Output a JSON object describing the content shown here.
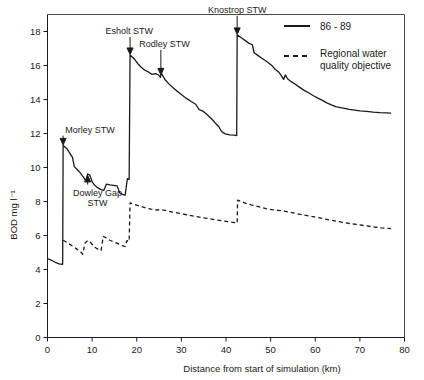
{
  "chart_data": {
    "type": "line",
    "title": "",
    "xlabel": "Distance from start of simulation (km)",
    "ylabel": "BOD mg l⁻¹",
    "xlim": [
      0,
      80
    ],
    "ylim": [
      0,
      19
    ],
    "xticks": [
      "0",
      "10",
      "20",
      "30",
      "40",
      "50",
      "60",
      "70",
      "80"
    ],
    "xtick_values": [
      0,
      10,
      20,
      30,
      40,
      50,
      60,
      70,
      80
    ],
    "yticks": [
      "0",
      "2",
      "4",
      "6",
      "8",
      "10",
      "12",
      "14",
      "16",
      "18"
    ],
    "ytick_values": [
      0,
      2,
      4,
      6,
      8,
      10,
      12,
      14,
      16,
      18
    ],
    "grid": false,
    "legend_position": "top-right",
    "series": [
      {
        "name": "86 - 89",
        "style": "solid",
        "color": "#1a1a1a",
        "points": [
          [
            0.0,
            4.62
          ],
          [
            0.6,
            4.58
          ],
          [
            1.2,
            4.5
          ],
          [
            1.9,
            4.4
          ],
          [
            2.6,
            4.33
          ],
          [
            3.4,
            4.31
          ],
          [
            3.5,
            11.3
          ],
          [
            4.3,
            11.12
          ],
          [
            5.0,
            10.85
          ],
          [
            5.6,
            10.6
          ],
          [
            6.0,
            10.05
          ],
          [
            6.6,
            9.9
          ],
          [
            7.3,
            9.7
          ],
          [
            8.0,
            9.45
          ],
          [
            8.6,
            9.2
          ],
          [
            9.0,
            9.62
          ],
          [
            9.5,
            9.55
          ],
          [
            10.0,
            9.15
          ],
          [
            10.6,
            8.95
          ],
          [
            11.3,
            8.8
          ],
          [
            12.0,
            8.7
          ],
          [
            12.6,
            8.65
          ],
          [
            13.2,
            9.02
          ],
          [
            14.0,
            8.98
          ],
          [
            14.8,
            8.95
          ],
          [
            15.6,
            8.92
          ],
          [
            16.2,
            8.5
          ],
          [
            16.8,
            8.42
          ],
          [
            17.4,
            8.38
          ],
          [
            17.9,
            9.35
          ],
          [
            18.3,
            9.3
          ],
          [
            18.5,
            16.62
          ],
          [
            19.4,
            16.4
          ],
          [
            20.2,
            16.12
          ],
          [
            21.0,
            15.9
          ],
          [
            21.8,
            15.72
          ],
          [
            22.6,
            15.62
          ],
          [
            23.4,
            15.48
          ],
          [
            24.2,
            15.52
          ],
          [
            24.9,
            15.44
          ],
          [
            25.3,
            15.3
          ],
          [
            25.5,
            15.55
          ],
          [
            26.3,
            15.18
          ],
          [
            27.2,
            14.92
          ],
          [
            28.2,
            14.68
          ],
          [
            29.2,
            14.45
          ],
          [
            30.2,
            14.25
          ],
          [
            31.2,
            14.05
          ],
          [
            32.2,
            13.88
          ],
          [
            33.2,
            13.72
          ],
          [
            34.0,
            13.4
          ],
          [
            34.8,
            13.32
          ],
          [
            35.8,
            13.1
          ],
          [
            36.8,
            12.85
          ],
          [
            37.6,
            12.62
          ],
          [
            38.4,
            12.4
          ],
          [
            39.0,
            12.12
          ],
          [
            39.8,
            11.98
          ],
          [
            40.8,
            11.92
          ],
          [
            41.8,
            11.9
          ],
          [
            42.4,
            11.88
          ],
          [
            42.5,
            17.8
          ],
          [
            43.6,
            17.6
          ],
          [
            44.4,
            17.45
          ],
          [
            45.2,
            17.3
          ],
          [
            45.9,
            17.22
          ],
          [
            46.3,
            16.75
          ],
          [
            47.2,
            16.58
          ],
          [
            48.2,
            16.4
          ],
          [
            49.2,
            16.22
          ],
          [
            50.2,
            16.02
          ],
          [
            51.0,
            15.78
          ],
          [
            51.8,
            15.62
          ],
          [
            52.4,
            15.4
          ],
          [
            52.9,
            15.18
          ],
          [
            53.3,
            15.45
          ],
          [
            53.8,
            15.22
          ],
          [
            54.6,
            15.05
          ],
          [
            55.6,
            14.88
          ],
          [
            56.6,
            14.7
          ],
          [
            57.6,
            14.52
          ],
          [
            58.6,
            14.38
          ],
          [
            59.6,
            14.22
          ],
          [
            60.6,
            14.08
          ],
          [
            61.6,
            13.95
          ],
          [
            62.6,
            13.8
          ],
          [
            63.6,
            13.68
          ],
          [
            64.6,
            13.58
          ],
          [
            65.6,
            13.52
          ],
          [
            66.6,
            13.48
          ],
          [
            67.6,
            13.42
          ],
          [
            68.8,
            13.38
          ],
          [
            70.0,
            13.33
          ],
          [
            71.5,
            13.3
          ],
          [
            73.0,
            13.26
          ],
          [
            74.5,
            13.23
          ],
          [
            76.0,
            13.21
          ],
          [
            77.0,
            13.2
          ]
        ]
      },
      {
        "name": "Regional water quality objective",
        "style": "dashed",
        "color": "#1a1a1a",
        "points": [
          [
            3.5,
            5.72
          ],
          [
            4.2,
            5.62
          ],
          [
            5.0,
            5.48
          ],
          [
            5.8,
            5.35
          ],
          [
            6.6,
            5.2
          ],
          [
            7.4,
            5.05
          ],
          [
            7.9,
            4.9
          ],
          [
            8.4,
            5.55
          ],
          [
            9.0,
            5.7
          ],
          [
            9.6,
            5.6
          ],
          [
            10.2,
            5.42
          ],
          [
            10.8,
            5.28
          ],
          [
            11.4,
            5.18
          ],
          [
            12.0,
            5.12
          ],
          [
            12.5,
            5.95
          ],
          [
            13.2,
            5.85
          ],
          [
            14.0,
            5.72
          ],
          [
            14.8,
            5.62
          ],
          [
            15.6,
            5.55
          ],
          [
            16.2,
            5.48
          ],
          [
            16.8,
            5.4
          ],
          [
            17.4,
            5.35
          ],
          [
            17.8,
            5.7
          ],
          [
            18.3,
            5.65
          ],
          [
            18.5,
            7.92
          ],
          [
            19.6,
            7.82
          ],
          [
            20.8,
            7.72
          ],
          [
            22.0,
            7.62
          ],
          [
            23.2,
            7.55
          ],
          [
            24.4,
            7.5
          ],
          [
            25.4,
            7.52
          ],
          [
            26.6,
            7.46
          ],
          [
            28.0,
            7.38
          ],
          [
            29.6,
            7.3
          ],
          [
            31.2,
            7.22
          ],
          [
            32.8,
            7.14
          ],
          [
            34.4,
            7.06
          ],
          [
            36.0,
            7.0
          ],
          [
            37.6,
            6.92
          ],
          [
            39.2,
            6.86
          ],
          [
            40.8,
            6.8
          ],
          [
            42.0,
            6.76
          ],
          [
            42.5,
            6.72
          ],
          [
            42.6,
            8.08
          ],
          [
            43.6,
            7.98
          ],
          [
            44.6,
            7.88
          ],
          [
            45.6,
            7.8
          ],
          [
            46.6,
            7.74
          ],
          [
            47.8,
            7.66
          ],
          [
            49.0,
            7.58
          ],
          [
            50.2,
            7.52
          ],
          [
            51.4,
            7.48
          ],
          [
            52.6,
            7.45
          ],
          [
            54.0,
            7.38
          ],
          [
            55.6,
            7.3
          ],
          [
            57.2,
            7.22
          ],
          [
            58.8,
            7.14
          ],
          [
            60.4,
            7.06
          ],
          [
            62.0,
            6.98
          ],
          [
            63.6,
            6.9
          ],
          [
            65.2,
            6.82
          ],
          [
            66.8,
            6.74
          ],
          [
            68.4,
            6.68
          ],
          [
            70.0,
            6.62
          ],
          [
            71.6,
            6.56
          ],
          [
            73.2,
            6.5
          ],
          [
            74.8,
            6.45
          ],
          [
            76.2,
            6.42
          ],
          [
            77.0,
            6.4
          ]
        ]
      }
    ],
    "annotations": [
      {
        "label": "Morley STW",
        "x": 3.5,
        "y": 11.3,
        "label_x": 4.0,
        "label_y": 12.05,
        "text_anchor": "start",
        "arrow": "down"
      },
      {
        "label": "Dowley Gap STW",
        "label_line_1": "Dowley Gap",
        "label_line_2": "STW",
        "x": 9.0,
        "y": 9.62,
        "label_x": 11.2,
        "label_y": 8.35,
        "text_anchor": "middle",
        "arrow": "up"
      },
      {
        "label": "Esholt STW",
        "x": 18.5,
        "y": 16.62,
        "label_x": 18.3,
        "label_y": 17.85,
        "text_anchor": "middle",
        "arrow": "down"
      },
      {
        "label": "Rodley STW",
        "x": 25.4,
        "y": 15.42,
        "label_x": 26.2,
        "label_y": 17.1,
        "text_anchor": "middle",
        "arrow": "down"
      },
      {
        "label": "Knostrop STW",
        "x": 42.5,
        "y": 17.8,
        "label_x": 42.5,
        "label_y": 19.1,
        "text_anchor": "middle",
        "arrow": "down"
      }
    ],
    "legend": [
      {
        "label": "86 - 89",
        "style": "solid"
      },
      {
        "label": "Regional water",
        "label2": "quality objective",
        "style": "dashed"
      }
    ]
  }
}
